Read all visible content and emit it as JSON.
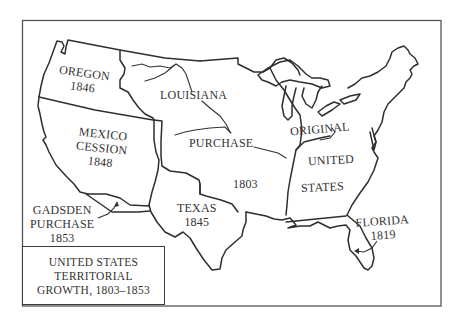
{
  "map": {
    "title_lines": [
      "UNITED STATES",
      "TERRITORIAL",
      "GROWTH, 1803–1853"
    ],
    "regions": [
      {
        "id": "oregon",
        "name": "OREGON",
        "year": "1846"
      },
      {
        "id": "louisiana",
        "name_line1": "LOUISIANA",
        "name_line2": "PURCHASE",
        "year": "1803"
      },
      {
        "id": "mexico-cession",
        "name_line1": "MEXICO",
        "name_line2": "CESSION",
        "year": "1848"
      },
      {
        "id": "gadsden",
        "name_line1": "GADSDEN",
        "name_line2": "PURCHASE",
        "year": "1853"
      },
      {
        "id": "texas",
        "name": "TEXAS",
        "year": "1845"
      },
      {
        "id": "original",
        "name_line1": "ORIGINAL",
        "name_line2": "UNITED",
        "name_line3": "STATES"
      },
      {
        "id": "florida",
        "name": "FLORIDA",
        "year": "1819"
      }
    ],
    "colors": {
      "line": "#2e2e2e",
      "frame": "#555555",
      "background": "#ffffff"
    }
  }
}
